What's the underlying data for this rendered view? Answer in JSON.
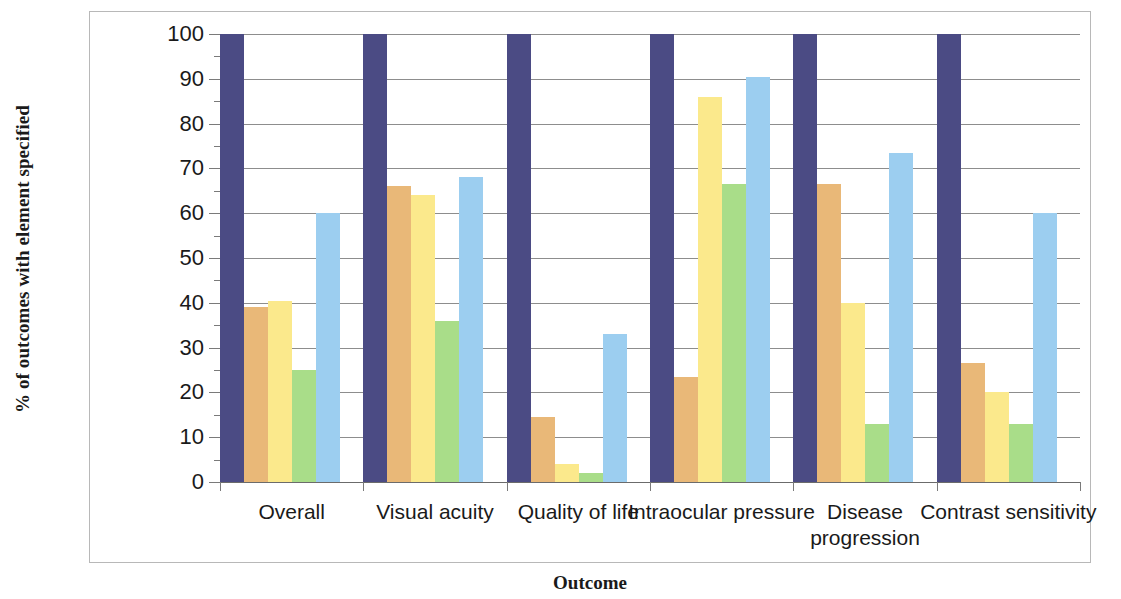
{
  "chart_data": {
    "type": "bar",
    "title": "",
    "xlabel": "Outcome",
    "ylabel": "% of outcomes with element specified",
    "ylim": [
      0,
      100
    ],
    "ytick_labels": [
      "100",
      "90",
      "80",
      "70",
      "60",
      "50",
      "40",
      "30",
      "20",
      "10",
      "0"
    ],
    "ytick_values": [
      100,
      90,
      80,
      70,
      60,
      50,
      40,
      30,
      20,
      10,
      0
    ],
    "grid": true,
    "legend": false,
    "legend_position": "none",
    "categories": [
      "Overall",
      "Visual acuity",
      "Quality of life",
      "Intraocular pressure",
      "Disease progression",
      "Contrast sensitivity"
    ],
    "series": [
      {
        "name": "series-1",
        "color": "#4b4b84",
        "values": [
          100,
          100,
          100,
          100,
          100,
          100
        ]
      },
      {
        "name": "series-2",
        "color": "#e9b878",
        "values": [
          39,
          66,
          14.5,
          23.5,
          66.5,
          26.5
        ]
      },
      {
        "name": "series-3",
        "color": "#fbe98c",
        "values": [
          40.5,
          64,
          4,
          86,
          40,
          20
        ]
      },
      {
        "name": "series-4",
        "color": "#a9dd89",
        "values": [
          25,
          36,
          2,
          66.5,
          13,
          13
        ]
      },
      {
        "name": "series-5",
        "color": "#9ccef0",
        "values": [
          60,
          68,
          33,
          90.5,
          73.5,
          60
        ]
      }
    ]
  }
}
